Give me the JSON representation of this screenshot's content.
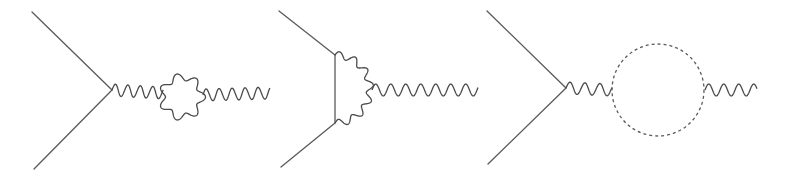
{
  "figure": {
    "background": "#ffffff",
    "stroke_color": "#4a4a4a"
  },
  "diagrams": [
    {
      "id": "diagram-1",
      "kind": "propagator-loop-correction",
      "vertex": [
        112,
        90
      ],
      "external_lines": [
        [
          [
            32,
            12
          ],
          [
            112,
            90
          ]
        ],
        [
          [
            34,
            169
          ],
          [
            112,
            90
          ]
        ]
      ],
      "photon_in": {
        "from": [
          112,
          90
        ],
        "to": [
          163,
          93
        ],
        "wavelength": 12.5
      },
      "loop": {
        "type": "wavy-ring",
        "center": [
          182,
          97
        ],
        "radius": 20,
        "lobes": 7
      },
      "photon_out": {
        "from": [
          203,
          95
        ],
        "to": [
          270,
          93
        ],
        "wavelength": 13
      }
    },
    {
      "id": "diagram-2",
      "kind": "vertex-correction",
      "external_lines": [
        [
          [
            279,
            11
          ],
          [
            335,
            55
          ]
        ],
        [
          [
            281,
            167
          ],
          [
            335,
            123
          ]
        ]
      ],
      "fermion_propagator": {
        "from": [
          335,
          55
        ],
        "to": [
          335,
          123
        ]
      },
      "exchanged_photon_arc": {
        "from": [
          335,
          55
        ],
        "via": [
          370,
          89
        ],
        "to": [
          335,
          123
        ]
      },
      "photon_out": {
        "from": [
          372,
          90
        ],
        "to": [
          478,
          90
        ],
        "wavelength": 15
      }
    },
    {
      "id": "diagram-3",
      "kind": "scalar-loop-correction",
      "vertex": [
        566,
        88
      ],
      "external_lines": [
        [
          [
            487,
            11
          ],
          [
            566,
            88
          ]
        ],
        [
          [
            488,
            164
          ],
          [
            566,
            88
          ]
        ]
      ],
      "photon_in": {
        "from": [
          566,
          88
        ],
        "to": [
          612,
          90
        ],
        "wavelength": 15
      },
      "loop": {
        "type": "dashed-circle",
        "center": [
          658,
          90
        ],
        "radius": 46
      },
      "photon_out": {
        "from": [
          705,
          90
        ],
        "to": [
          757,
          90
        ],
        "wavelength": 15
      }
    }
  ]
}
